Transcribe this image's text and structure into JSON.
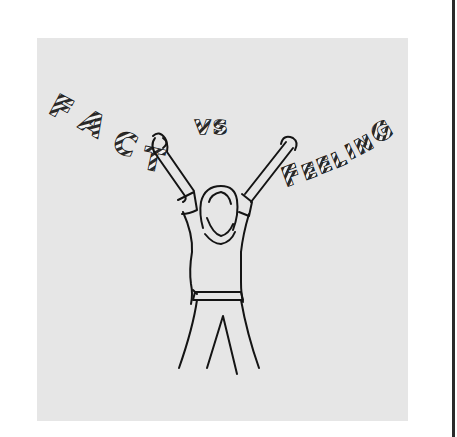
{
  "illustration": {
    "title_left": "FACT",
    "title_middle": "VS",
    "title_right": "FEELING",
    "description": "Hand-drawn sketch of a person with arms raised, holding the word FACT in the left hand and FEELING in the right hand, with VS between them",
    "colors": {
      "background": "#ffffff",
      "panel": "#e6e6e6",
      "ink": "#141414",
      "page_edge": "#2a2a2a"
    }
  },
  "letters": {
    "fact": [
      "F",
      "A",
      "C",
      "T"
    ],
    "vs": [
      "V",
      "S"
    ],
    "feeling": [
      "F",
      "E",
      "E",
      "L",
      "I",
      "N",
      "G"
    ]
  }
}
